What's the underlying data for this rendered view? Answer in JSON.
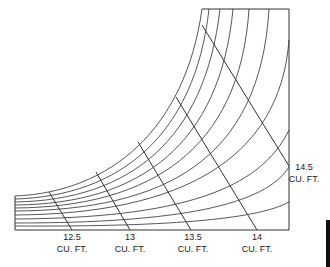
{
  "diagram": {
    "type": "nomograph-curves",
    "frame_color": "#333333",
    "line_color": "#444444",
    "curves": [
      {
        "id": 1,
        "d": "M15,196 C110,192 185,130 202,9"
      },
      {
        "id": 2,
        "d": "M15,199 C120,196 195,135 209,9"
      },
      {
        "id": 3,
        "d": "M15,202 C130,200 205,140 220,9"
      },
      {
        "id": 4,
        "d": "M15,205 C140,204 220,145 233,9"
      },
      {
        "id": 5,
        "d": "M15,208 C150,207 240,150 249,9"
      },
      {
        "id": 6,
        "d": "M15,211 C165,210 260,160 269,9"
      },
      {
        "id": 7,
        "d": "M15,215 C180,214 280,160 289,40"
      },
      {
        "id": 8,
        "d": "M15,219 C180,218 260,190 289,130"
      },
      {
        "id": 9,
        "d": "M15,223 C180,223 265,205 289,167"
      },
      {
        "id": 10,
        "d": "M15,226 C180,227 260,218 289,202"
      }
    ],
    "volume_lines": [
      {
        "label": "12.5",
        "x1": 49,
        "y1": 192,
        "x2": 72,
        "y2": 230
      },
      {
        "label": "13",
        "x1": 96,
        "y1": 172,
        "x2": 130,
        "y2": 230
      },
      {
        "label": "13.5",
        "x1": 138,
        "y1": 142,
        "x2": 191,
        "y2": 230
      },
      {
        "label": "14",
        "x1": 176,
        "y1": 97,
        "x2": 257,
        "y2": 230
      },
      {
        "label": "14.5",
        "x1": 202,
        "y1": 25,
        "x2": 289,
        "y2": 166
      }
    ],
    "labels": [
      {
        "value": "12.5",
        "unit": "CU. FT."
      },
      {
        "value": "13",
        "unit": "CU. FT."
      },
      {
        "value": "13.5",
        "unit": "CU. FT."
      },
      {
        "value": "14",
        "unit": "CU. FT."
      },
      {
        "value": "14.5",
        "unit": "CU. FT."
      }
    ]
  }
}
